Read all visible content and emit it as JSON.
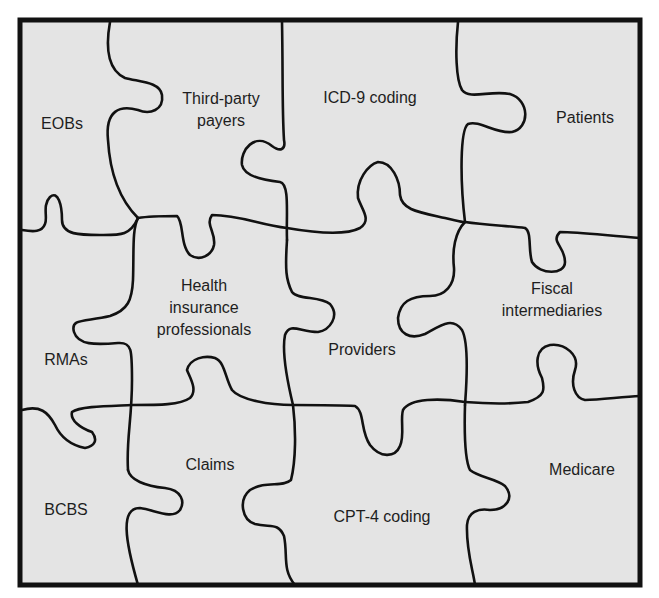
{
  "diagram": {
    "type": "jigsaw-puzzle",
    "colors": {
      "background": "#e4e4e4",
      "stroke": "#111111",
      "text": "#1e1e1e"
    },
    "pieces": [
      {
        "label": "EOBs"
      },
      {
        "label": "Third-party payers",
        "lines": [
          "Third-party",
          "payers"
        ]
      },
      {
        "label": "ICD-9 coding"
      },
      {
        "label": "Patients"
      },
      {
        "label": "RMAs"
      },
      {
        "label": "Health insurance professionals",
        "lines": [
          "Health",
          "insurance",
          "professionals"
        ]
      },
      {
        "label": "Providers"
      },
      {
        "label": "Fiscal intermediaries",
        "lines": [
          "Fiscal",
          "intermediaries"
        ]
      },
      {
        "label": "BCBS"
      },
      {
        "label": "Claims"
      },
      {
        "label": "CPT-4 coding"
      },
      {
        "label": "Medicare"
      }
    ]
  }
}
